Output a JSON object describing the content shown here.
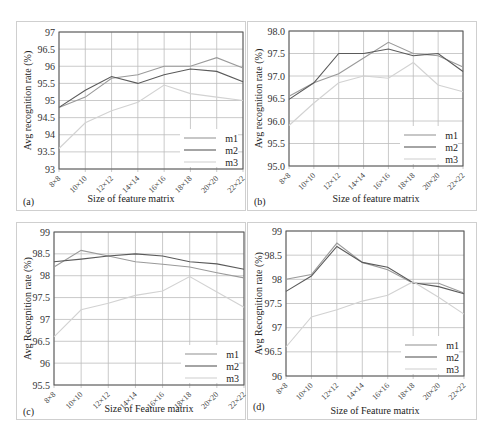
{
  "figure": {
    "series_names": [
      "m1",
      "m2",
      "m3"
    ],
    "series_colors": {
      "m1": "#9a9a9a",
      "m2": "#5a5a5a",
      "m3": "#d2d2d2"
    },
    "grid_color": "#bdbdbd",
    "axis_color": "#555555"
  },
  "chart_data": [
    {
      "panel": "(a)",
      "type": "line",
      "title": "",
      "xlabel": "Size of feature matrix",
      "ylabel": "Avg recognition  rate (%)",
      "categories": [
        "8×8",
        "10×10",
        "12×12",
        "14×14",
        "16×16",
        "18×18",
        "20×20",
        "22×22"
      ],
      "yticks": [
        "93",
        "93.5",
        "94",
        "94.5",
        "95",
        "95.5",
        "96",
        "96.5",
        "97"
      ],
      "ylim": [
        93,
        97
      ],
      "grid": true,
      "legend_position": "lower right",
      "series": [
        {
          "name": "m1",
          "values": [
            94.8,
            95.1,
            95.65,
            95.75,
            96.0,
            96.0,
            96.25,
            95.95
          ]
        },
        {
          "name": "m2",
          "values": [
            94.8,
            95.3,
            95.7,
            95.5,
            95.75,
            95.92,
            95.85,
            95.55
          ]
        },
        {
          "name": "m3",
          "values": [
            93.6,
            94.35,
            94.7,
            94.95,
            95.45,
            95.2,
            95.1,
            95.0
          ]
        }
      ]
    },
    {
      "panel": "(b)",
      "type": "line",
      "title": "",
      "xlabel": "Size of feature matrix",
      "ylabel": "Avg recognition  rate (%)",
      "categories": [
        "8×8",
        "10×10",
        "12×12",
        "14×14",
        "16×16",
        "18×18",
        "20×20",
        "22×22"
      ],
      "yticks": [
        "95.0",
        "95.5",
        "96.0",
        "96.5",
        "97.0",
        "97.5",
        "98.0"
      ],
      "ylim": [
        95.0,
        98.0
      ],
      "grid": true,
      "legend_position": "lower right",
      "series": [
        {
          "name": "m1",
          "values": [
            96.55,
            96.85,
            97.05,
            97.4,
            97.75,
            97.5,
            97.45,
            97.2
          ]
        },
        {
          "name": "m2",
          "values": [
            96.48,
            96.85,
            97.5,
            97.5,
            97.6,
            97.45,
            97.5,
            97.1
          ]
        },
        {
          "name": "m3",
          "values": [
            95.9,
            96.4,
            96.85,
            97.0,
            96.95,
            97.3,
            96.8,
            96.65
          ]
        }
      ]
    },
    {
      "panel": "(c)",
      "type": "line",
      "title": "",
      "xlabel": "Size of Feature matrix",
      "ylabel": "Avg Recognition  rate (%)",
      "categories": [
        "8×8",
        "10×10",
        "12×12",
        "14×14",
        "16×16",
        "18×18",
        "20×20",
        "22×22"
      ],
      "yticks": [
        "95.5",
        "96",
        "96.5",
        "97",
        "97.5",
        "98",
        "98.5",
        "99"
      ],
      "ylim": [
        95.5,
        99
      ],
      "grid": true,
      "legend_position": "lower right",
      "series": [
        {
          "name": "m1",
          "values": [
            98.2,
            98.58,
            98.45,
            98.32,
            98.26,
            98.2,
            98.07,
            97.95
          ]
        },
        {
          "name": "m2",
          "values": [
            98.32,
            98.38,
            98.45,
            98.5,
            98.45,
            98.32,
            98.27,
            98.15
          ]
        },
        {
          "name": "m3",
          "values": [
            96.6,
            97.22,
            97.37,
            97.55,
            97.65,
            97.98,
            97.63,
            97.28
          ]
        }
      ]
    },
    {
      "panel": "(d)",
      "type": "line",
      "title": "",
      "xlabel": "Size of Feature matrix",
      "ylabel": "Avg Recognition  rate (%)",
      "categories": [
        "8×8",
        "10×10",
        "12×12",
        "14×14",
        "16×16",
        "18×18",
        "20×20",
        "22×22"
      ],
      "yticks": [
        "96",
        "96.5",
        "97",
        "97.5",
        "98",
        "98.5",
        "99"
      ],
      "ylim": [
        96,
        99
      ],
      "grid": true,
      "legend_position": "lower right",
      "series": [
        {
          "name": "m1",
          "values": [
            98.0,
            98.1,
            98.75,
            98.35,
            98.2,
            97.92,
            97.92,
            97.72
          ]
        },
        {
          "name": "m2",
          "values": [
            97.75,
            98.07,
            98.68,
            98.35,
            98.25,
            97.93,
            97.85,
            97.7
          ]
        },
        {
          "name": "m3",
          "values": [
            96.6,
            97.22,
            97.37,
            97.55,
            97.67,
            97.95,
            97.63,
            97.28
          ]
        }
      ]
    }
  ],
  "layout": [
    {
      "frame": [
        16,
        21,
        230,
        190
      ],
      "plot": [
        58,
        31,
        242,
        168
      ],
      "label_pos": [
        22,
        200
      ],
      "xlabel_pos": [
        130,
        201
      ]
    },
    {
      "frame": [
        247,
        21,
        230,
        190
      ],
      "plot": [
        288,
        30,
        462,
        165
      ],
      "label_pos": [
        253,
        200
      ],
      "xlabel_pos": [
        375,
        201
      ]
    },
    {
      "frame": [
        16,
        222,
        230,
        198
      ],
      "plot": [
        53,
        231,
        243,
        384
      ],
      "label_pos": [
        22,
        410
      ],
      "xlabel_pos": [
        148,
        411
      ]
    },
    {
      "frame": [
        247,
        222,
        230,
        198
      ],
      "plot": [
        285,
        230,
        463,
        375
      ],
      "label_pos": [
        252,
        405
      ],
      "xlabel_pos": [
        374,
        413
      ]
    }
  ]
}
